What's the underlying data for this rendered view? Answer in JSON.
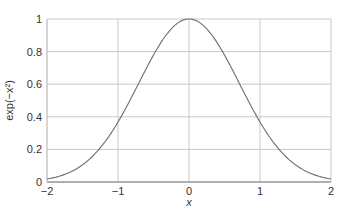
{
  "chart_data": {
    "type": "line",
    "title": "",
    "xlabel": "x",
    "ylabel": "exp(−x²)",
    "xlim": [
      -2,
      2
    ],
    "ylim": [
      0,
      1
    ],
    "grid": true,
    "legend": null,
    "x_ticks": [
      -2,
      -1,
      0,
      1,
      2
    ],
    "x_tick_labels": [
      "−2",
      "−1",
      "0",
      "1",
      "2"
    ],
    "y_ticks": [
      0,
      0.2,
      0.4,
      0.6,
      0.8,
      1
    ],
    "y_tick_labels": [
      "0",
      "0.2",
      "0.4",
      "0.6",
      "0.8",
      "1"
    ],
    "function": "exp(-x^2)",
    "series": [
      {
        "name": "exp(-x^2)",
        "x": [
          -2,
          -1.75,
          -1.5,
          -1.25,
          -1,
          -0.75,
          -0.5,
          -0.25,
          0,
          0.25,
          0.5,
          0.75,
          1,
          1.25,
          1.5,
          1.75,
          2
        ],
        "values": [
          0.018,
          0.047,
          0.105,
          0.21,
          0.368,
          0.57,
          0.779,
          0.939,
          1.0,
          0.939,
          0.779,
          0.57,
          0.368,
          0.21,
          0.105,
          0.047,
          0.018
        ]
      }
    ],
    "colors": {
      "curve": "#6e6e6e",
      "grid": "#c8c8c8",
      "axis": "#7a7a7a",
      "text": "#333333"
    }
  }
}
